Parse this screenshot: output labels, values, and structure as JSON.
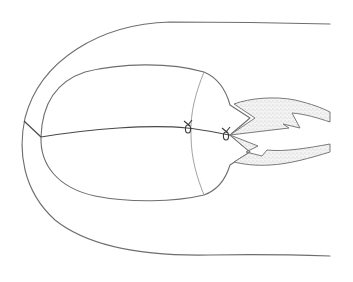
{
  "figure": {
    "type": "surgical-line-drawing",
    "colors": {
      "background": "#ffffff",
      "line": "#6e6e6e",
      "suture": "#4a4a4a",
      "stipple": "#9a9a9a"
    },
    "elements": {
      "outer_contour": "U-shaped outer boundary",
      "inner_oval": "oval structure with right-side neck",
      "transverse_line": "curved line dividing oval near right",
      "suture_line": "central suture line",
      "knots": 2,
      "flaps": 2
    }
  }
}
